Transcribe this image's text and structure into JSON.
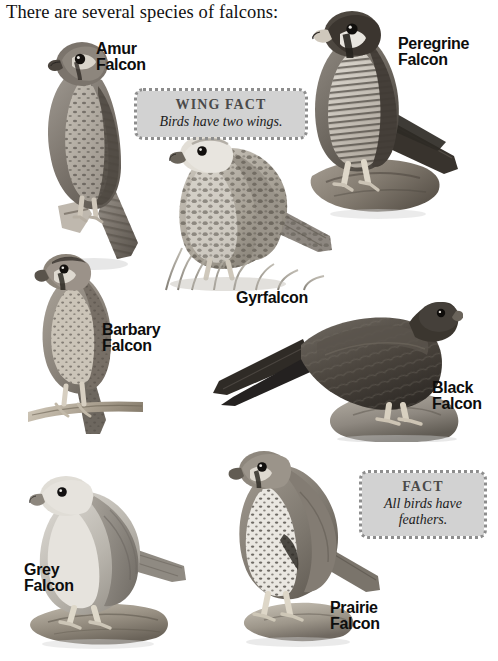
{
  "page": {
    "heading": "There are several species of falcons:",
    "background_color": "#ffffff",
    "width": 498,
    "height": 661
  },
  "species": [
    {
      "id": "amur",
      "label": "Amur\nFalcon",
      "label_x": 96,
      "label_y": 41,
      "label_size": 16,
      "image_alt": "Amur Falcon perched on a branch, grayscale photograph"
    },
    {
      "id": "peregrine",
      "label": "Peregrine\nFalcon",
      "label_x": 398,
      "label_y": 36,
      "label_size": 16,
      "image_alt": "Peregrine Falcon perched on a weathered log, grayscale photograph"
    },
    {
      "id": "gyrfalcon",
      "label": "Gyrfalcon",
      "label_x": 236,
      "label_y": 290,
      "label_size": 16,
      "image_alt": "Gyrfalcon standing in grass, grayscale photograph"
    },
    {
      "id": "barbary",
      "label": "Barbary\nFalcon",
      "label_x": 102,
      "label_y": 322,
      "label_size": 16,
      "image_alt": "Barbary Falcon perched on a wooden rod, grayscale photograph"
    },
    {
      "id": "black",
      "label": "Black\nFalcon",
      "label_x": 432,
      "label_y": 380,
      "label_size": 16,
      "image_alt": "Black Falcon standing on a rock, grayscale photograph"
    },
    {
      "id": "grey",
      "label": "Grey\nFalcon",
      "label_x": 24,
      "label_y": 562,
      "label_size": 16,
      "image_alt": "Grey Falcon perched on a log, grayscale photograph"
    },
    {
      "id": "prairie",
      "label": "Prairie\nFalcon",
      "label_x": 330,
      "label_y": 600,
      "label_size": 16,
      "image_alt": "Prairie Falcon perched on a rock, grayscale photograph"
    }
  ],
  "facts": [
    {
      "id": "wing-fact",
      "title": "Wing Fact",
      "body": "Birds have two wings.",
      "x": 138,
      "y": 92,
      "width": 166,
      "background_color": "#d2d2d2",
      "title_color": "#4a4a4a",
      "border_color": "#8d8d8d"
    },
    {
      "id": "fact",
      "title": "Fact",
      "body": "All birds have\nfeathers.",
      "x": 363,
      "y": 474,
      "width": 120,
      "background_color": "#d2d2d2",
      "title_color": "#4a4a4a",
      "border_color": "#8d8d8d"
    }
  ]
}
